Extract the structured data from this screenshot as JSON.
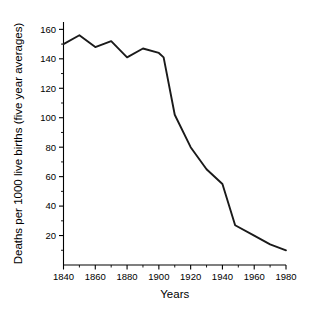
{
  "chart_data": {
    "type": "line",
    "title": "",
    "subtitle": "",
    "xlabel": "Years",
    "ylabel": "Deaths per 1000 live births (five year averages)",
    "xlim": [
      1840,
      1980
    ],
    "ylim": [
      0,
      165
    ],
    "grid": false,
    "legend": null,
    "x_ticks": [
      1840,
      1860,
      1880,
      1900,
      1920,
      1940,
      1960,
      1980
    ],
    "x_tick_labels": [
      "1840",
      "1860",
      "1880",
      "1900",
      "1920",
      "1940",
      "1960",
      "1980"
    ],
    "x_minor_ticks": [
      1850,
      1870,
      1890,
      1910,
      1930,
      1950,
      1970
    ],
    "y_ticks": [
      20,
      40,
      60,
      80,
      100,
      120,
      140,
      160
    ],
    "y_tick_labels": [
      "20",
      "40",
      "60",
      "80",
      "100",
      "120",
      "140",
      "160"
    ],
    "y_minor_ticks": [
      10,
      30,
      50,
      70,
      90,
      110,
      130,
      150
    ],
    "line_color": "#1a1a1a",
    "series": [
      {
        "name": "Infant mortality",
        "x": [
          1840,
          1850,
          1860,
          1870,
          1880,
          1890,
          1900,
          1903,
          1910,
          1920,
          1930,
          1940,
          1948,
          1960,
          1970,
          1980
        ],
        "values": [
          150,
          156,
          148,
          152,
          141,
          147,
          144,
          141,
          102,
          80,
          65,
          55,
          27,
          20,
          14,
          10
        ]
      }
    ]
  }
}
